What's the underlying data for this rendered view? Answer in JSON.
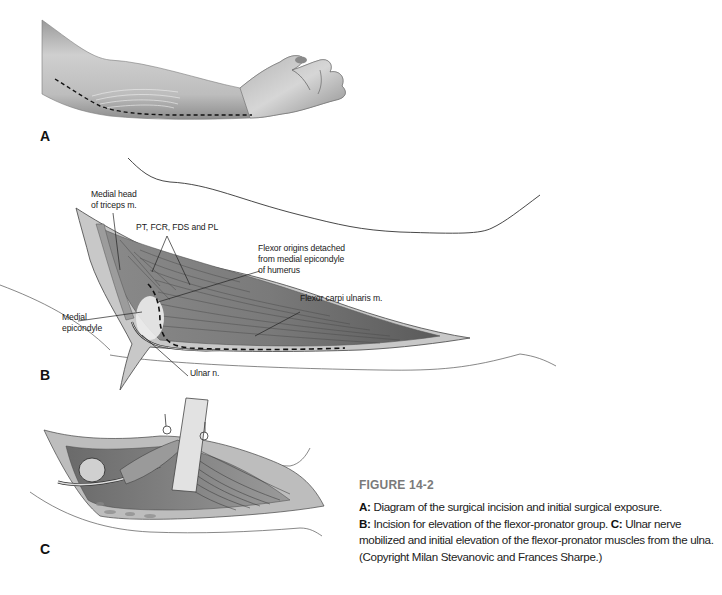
{
  "figure": {
    "title": "FIGURE 14-2",
    "caption": [
      {
        "key": "A:",
        "text": " Diagram of the surgical incision and initial surgical exposure."
      },
      {
        "key": "B:",
        "text": " Incision for elevation of the flexor-pronator group. "
      },
      {
        "key": "C:",
        "text": " Ulnar nerve mobilized and initial elevation of the flexor-pronator muscles from the ulna. (Copyright Milan Stevanovic and Frances Sharpe.)"
      }
    ]
  },
  "panels": {
    "a": {
      "letter": "A",
      "description": "Forearm with dashed incision line along medial side"
    },
    "b": {
      "letter": "B",
      "labels": {
        "medial_head_1": "Medial head",
        "medial_head_2": "of triceps m.",
        "pt_fcr": "PT, FCR, FDS and PL",
        "flexor_origins_1": "Flexor origins detached",
        "flexor_origins_2": "from medial epicondyle",
        "flexor_origins_3": "of humerus",
        "fcu": "Flexor carpi ulnaris m.",
        "medial_epicondyle_1": "Medial",
        "medial_epicondyle_2": "epicondyle",
        "ulnar_nerve": "Ulnar n."
      }
    },
    "c": {
      "letter": "C",
      "description": "Ulnar nerve mobilized with retractors elevating flexor-pronator muscles"
    }
  },
  "colors": {
    "ink": "#1a1a1a",
    "muscle_dark": "#6e6e6e",
    "muscle_mid": "#a3a3a3",
    "skin": "#d9d9d9",
    "caption_title": "#7a7a7a"
  }
}
